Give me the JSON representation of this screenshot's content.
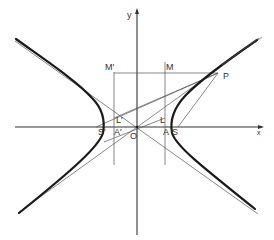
{
  "figure": {
    "colors": {
      "background": "#ffffff",
      "ink": "#1a1a1a",
      "thin_line": "#555555"
    }
  },
  "labels": {
    "y_axis": "y",
    "x_axis": "x",
    "origin": "O",
    "vertex_right": "A",
    "vertex_left": "A'",
    "focus_right": "S",
    "focus_left": "S'",
    "directrix_point_right": "L",
    "directrix_point_left": "L'",
    "foot_right": "M",
    "foot_left": "M'",
    "point": "P"
  },
  "geometry": {
    "origin": [
      137,
      127
    ],
    "x_axis": {
      "from": [
        15,
        127
      ],
      "to": [
        262,
        127
      ]
    },
    "y_axis": {
      "from": [
        137,
        235
      ],
      "to": [
        137,
        10
      ]
    },
    "directrix_right_x": 165,
    "directrix_left_x": 114,
    "directrix_y_range": [
      62,
      165
    ],
    "vertex_right": [
      170,
      127
    ],
    "vertex_left": [
      104,
      127
    ],
    "focus_right": [
      178,
      127
    ],
    "focus_left": [
      96,
      127
    ],
    "P": [
      218,
      73
    ],
    "asymptote_1": {
      "from": [
        15,
        42
      ],
      "to": [
        258,
        213
      ]
    },
    "asymptote_2": {
      "from": [
        18,
        213
      ],
      "to": [
        262,
        38
      ]
    }
  }
}
